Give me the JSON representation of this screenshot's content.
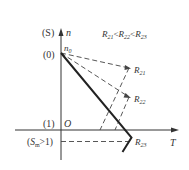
{
  "diagram": {
    "axes": {
      "y_axis_label": "n",
      "y_axis_paren_label": "(S)",
      "x_axis_label": "T",
      "origin_label": "O"
    },
    "y_ticks": [
      {
        "label": "(0)",
        "meaning": "n0 level"
      },
      {
        "label": "(1)",
        "meaning": "axis level"
      },
      {
        "label": "(S_m>1)",
        "meaning": "below axis"
      }
    ],
    "point_label_n0": "n",
    "point_label_n0_sub": "0",
    "relation": {
      "r1": "R",
      "r1_sub": "21",
      "lt1": "<",
      "r2": "R",
      "r2_sub": "22",
      "lt2": "<",
      "r3": "R",
      "r3_sub": "23"
    },
    "lines": [
      {
        "label": "R",
        "sub": "21"
      },
      {
        "label": "R",
        "sub": "22"
      },
      {
        "label": "R",
        "sub": "23"
      }
    ],
    "sm_label_S": "S",
    "sm_label_sub": "m",
    "sm_label_rest": ">1)",
    "colors": {
      "stroke": "#333333",
      "background": "#ffffff"
    }
  }
}
